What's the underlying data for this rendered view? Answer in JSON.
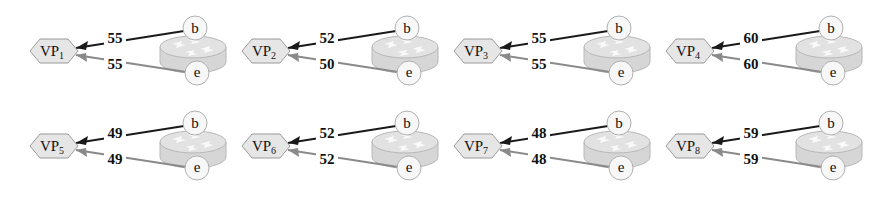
{
  "diagram": {
    "panels": [
      {
        "vp": "VP",
        "sub": "1",
        "b_label": "b",
        "e_label": "e",
        "b_value": "55",
        "e_value": "55"
      },
      {
        "vp": "VP",
        "sub": "2",
        "b_label": "b",
        "e_label": "e",
        "b_value": "52",
        "e_value": "50"
      },
      {
        "vp": "VP",
        "sub": "3",
        "b_label": "b",
        "e_label": "e",
        "b_value": "55",
        "e_value": "55"
      },
      {
        "vp": "VP",
        "sub": "4",
        "b_label": "b",
        "e_label": "e",
        "b_value": "60",
        "e_value": "60"
      },
      {
        "vp": "VP",
        "sub": "5",
        "b_label": "b",
        "e_label": "e",
        "b_value": "49",
        "e_value": "49"
      },
      {
        "vp": "VP",
        "sub": "6",
        "b_label": "b",
        "e_label": "e",
        "b_value": "52",
        "e_value": "52"
      },
      {
        "vp": "VP",
        "sub": "7",
        "b_label": "b",
        "e_label": "e",
        "b_value": "48",
        "e_value": "48"
      },
      {
        "vp": "VP",
        "sub": "8",
        "b_label": "b",
        "e_label": "e",
        "b_value": "59",
        "e_value": "59"
      }
    ],
    "colors": {
      "b_arrow": "#1a1a1a",
      "e_arrow": "#8a8a8a",
      "hexagon_fill": "#e6e6e6",
      "hexagon_stroke": "#9a9a9a",
      "router_fill": "#d6d6d6",
      "router_stroke": "#b8b8b8",
      "node_fill": "#f7f7f7",
      "node_stroke": "#b0b0b0"
    }
  }
}
